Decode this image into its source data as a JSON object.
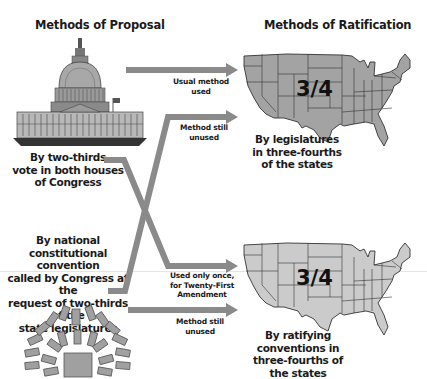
{
  "titles": {
    "proposal": "Methods of Proposal",
    "ratification": "Methods of Ratification"
  },
  "proposal_methods": [
    {
      "lines": [
        "By two-thirds",
        "vote in both houses",
        "of Congress"
      ],
      "icon": "capitol-building-icon"
    },
    {
      "lines": [
        "By national",
        "constitutional convention",
        "called by Congress at the",
        "request of two-thirds of the",
        "state legislatures"
      ],
      "icon": "convention-seating-icon"
    }
  ],
  "ratification_methods": [
    {
      "lines": [
        "By legislatures",
        "in three-fourths",
        "of the states"
      ],
      "fraction": "3/4",
      "map_fill": "#a3a3a3"
    },
    {
      "lines": [
        "By ratifying",
        "conventions in",
        "three-fourths of",
        "the states"
      ],
      "fraction": "3/4",
      "map_fill": "#cbcbcb"
    }
  ],
  "arrows": [
    {
      "from": "congress",
      "to": "legislatures",
      "lines": [
        "Usual method",
        "used"
      ]
    },
    {
      "from": "convention",
      "to": "legislatures",
      "lines": [
        "Method still",
        "unused"
      ]
    },
    {
      "from": "congress",
      "to": "conventions",
      "lines": [
        "Used only once,",
        "for Twenty-First",
        "Amendment"
      ]
    },
    {
      "from": "convention",
      "to": "conventions",
      "lines": [
        "Method still",
        "unused"
      ]
    }
  ],
  "colors": {
    "arrow": "#8a8a8a",
    "map_border": "#333333",
    "seat_fill": "#9e9e9e"
  }
}
